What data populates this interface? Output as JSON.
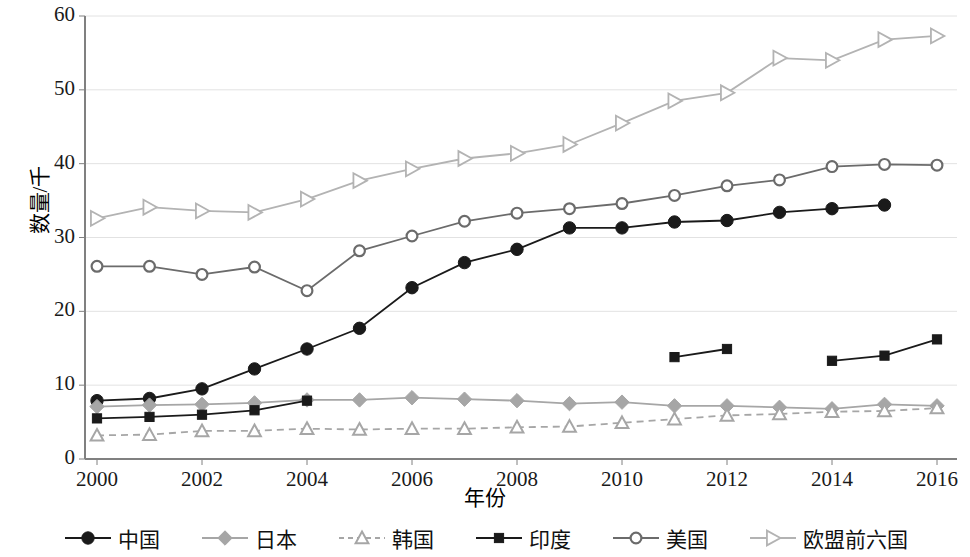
{
  "chart_data": {
    "type": "line",
    "title": "",
    "xlabel": "年份",
    "ylabel": "数量/千",
    "x": [
      2000,
      2001,
      2002,
      2003,
      2004,
      2005,
      2006,
      2007,
      2008,
      2009,
      2010,
      2011,
      2012,
      2013,
      2014,
      2015,
      2016
    ],
    "xlim": [
      2000,
      2016
    ],
    "ylim": [
      0,
      60
    ],
    "yticks": [
      0,
      10,
      20,
      30,
      40,
      50,
      60
    ],
    "xticks": [
      2000,
      2002,
      2004,
      2006,
      2008,
      2010,
      2012,
      2014,
      2016
    ],
    "grid": "horizontal",
    "legend_position": "bottom",
    "series": [
      {
        "name": "中国",
        "color": "#1a1a1a",
        "marker": "circle-filled",
        "dash": "solid",
        "values": [
          7.9,
          8.2,
          9.5,
          12.2,
          14.9,
          17.7,
          23.2,
          26.6,
          28.4,
          31.3,
          31.3,
          32.1,
          32.3,
          33.4,
          33.9,
          34.4,
          null
        ]
      },
      {
        "name": "日本",
        "color": "#a6a6a6",
        "marker": "diamond-filled",
        "dash": "solid",
        "values": [
          7.1,
          7.3,
          7.4,
          7.6,
          8.0,
          8.0,
          8.3,
          8.1,
          7.9,
          7.5,
          7.7,
          7.2,
          7.2,
          7.0,
          6.8,
          7.4,
          7.2
        ]
      },
      {
        "name": "韩国",
        "color": "#a6a6a6",
        "marker": "triangle-up-open",
        "dash": "dashed",
        "values": [
          3.2,
          3.3,
          3.8,
          3.8,
          4.1,
          4.0,
          4.1,
          4.1,
          4.3,
          4.4,
          4.9,
          5.4,
          5.9,
          6.1,
          6.4,
          6.5,
          6.9
        ]
      },
      {
        "name": "印度",
        "color": "#1a1a1a",
        "marker": "square-filled",
        "dash": "solid",
        "values": [
          5.5,
          5.7,
          6.0,
          6.6,
          7.9,
          null,
          null,
          null,
          null,
          null,
          null,
          13.8,
          14.9,
          null,
          13.3,
          14.0,
          16.2
        ]
      },
      {
        "name": "美国",
        "color": "#6b6b6b",
        "marker": "circle-open",
        "dash": "solid",
        "values": [
          26.1,
          26.1,
          25.0,
          26.0,
          22.8,
          28.2,
          30.2,
          32.2,
          33.3,
          33.9,
          34.6,
          35.7,
          37.0,
          37.8,
          39.6,
          39.9,
          39.8
        ]
      },
      {
        "name": "欧盟前六国",
        "color": "#b3b3b3",
        "marker": "triangle-right-open",
        "dash": "solid",
        "values": [
          32.6,
          34.1,
          33.6,
          33.4,
          35.2,
          37.7,
          39.3,
          40.7,
          41.4,
          42.6,
          45.5,
          48.5,
          49.6,
          54.3,
          54.0,
          56.8,
          57.3
        ]
      }
    ]
  },
  "axes": {
    "y_tick_labels": [
      "60",
      "50",
      "40",
      "30",
      "20",
      "10",
      "0"
    ],
    "x_tick_labels": [
      "2000",
      "2002",
      "2004",
      "2006",
      "2008",
      "2010",
      "2012",
      "2014",
      "2016"
    ],
    "y_title": "数量/千",
    "x_title": "年份"
  },
  "legend": {
    "items": [
      {
        "label": "中国"
      },
      {
        "label": "日本"
      },
      {
        "label": "韩国"
      },
      {
        "label": "印度"
      },
      {
        "label": "美国"
      },
      {
        "label": "欧盟前六国"
      }
    ]
  }
}
